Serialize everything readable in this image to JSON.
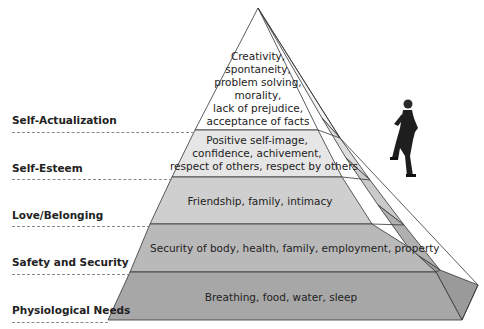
{
  "diagram": {
    "levels": [
      {
        "label": "Self-Actualization",
        "lines": [
          "Creativity,",
          "spontaneity,",
          "problem solving,",
          "morality,",
          "lack of prejudice,",
          "acceptance of facts"
        ],
        "color": "#ffffff"
      },
      {
        "label": "Self-Esteem",
        "lines": [
          "Positive self-image,",
          "confidence, achivement,",
          "respect of others, respect by others"
        ],
        "color": "#e6e6e6"
      },
      {
        "label": "Love/Belonging",
        "lines": [
          "Friendship, family, intimacy"
        ],
        "color": "#cfcfcf"
      },
      {
        "label": "Safety and Security",
        "lines": [
          "Security of body, health, family, employment, property"
        ],
        "color": "#b9b9b9"
      },
      {
        "label": "Physiological Needs",
        "lines": [
          "Breathing, food, water, sleep"
        ],
        "color": "#a7a7a7"
      }
    ],
    "figure": "climbing-businessman-icon"
  }
}
